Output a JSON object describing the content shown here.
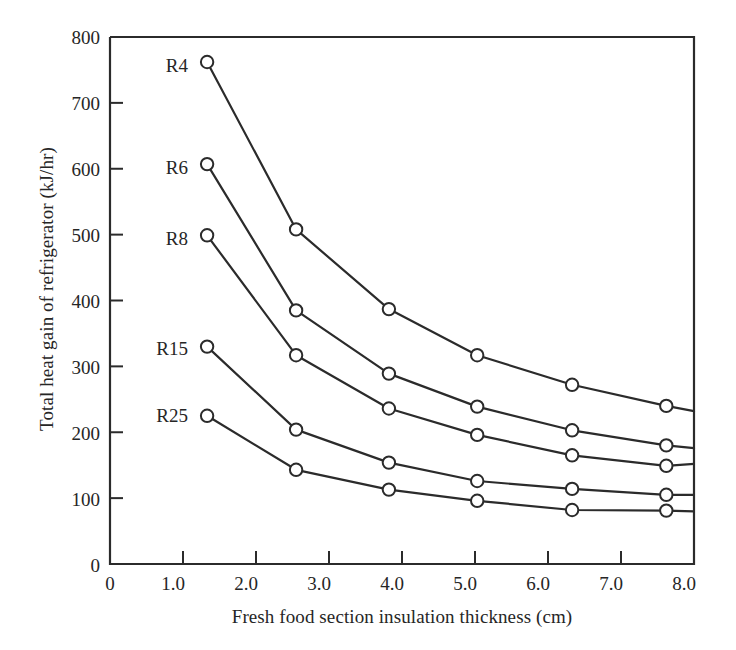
{
  "chart_data": {
    "type": "line",
    "title": "",
    "xlabel": "Fresh food section insulation thickness (cm)",
    "ylabel": "Total heat gain of refrigerator (kJ/hr)",
    "xlim": [
      0,
      8.0
    ],
    "ylim": [
      0,
      800
    ],
    "grid": false,
    "legend_position": "inline-left-of-first-point",
    "xticks": [
      "0",
      "1.0",
      "2.0",
      "3.0",
      "4.0",
      "5.0",
      "6.0",
      "7.0",
      "8.0"
    ],
    "xtick_values": [
      0,
      1.0,
      2.0,
      3.0,
      4.0,
      5.0,
      6.0,
      7.0,
      8.0
    ],
    "yticks": [
      "0",
      "100",
      "200",
      "300",
      "400",
      "500",
      "600",
      "700",
      "800"
    ],
    "ytick_values": [
      0,
      100,
      200,
      300,
      400,
      500,
      600,
      700,
      800
    ],
    "marker": "open-circle",
    "line_color": "#2b2b2b",
    "x": [
      1.33,
      2.55,
      3.82,
      5.03,
      6.33,
      7.62,
      8.0
    ],
    "series": [
      {
        "name": "R4",
        "label": "R4",
        "values": [
          762,
          508,
          387,
          317,
          272,
          240,
          232
        ]
      },
      {
        "name": "R6",
        "label": "R6",
        "values": [
          607,
          385,
          289,
          239,
          203,
          180,
          176
        ]
      },
      {
        "name": "R8",
        "label": "R8",
        "values": [
          499,
          317,
          236,
          196,
          165,
          149,
          152
        ]
      },
      {
        "name": "R15",
        "label": "R15",
        "values": [
          330,
          204,
          154,
          126,
          114,
          105,
          105
        ]
      },
      {
        "name": "R25",
        "label": "R25",
        "values": [
          225,
          143,
          113,
          96,
          82,
          81,
          80
        ]
      }
    ]
  }
}
